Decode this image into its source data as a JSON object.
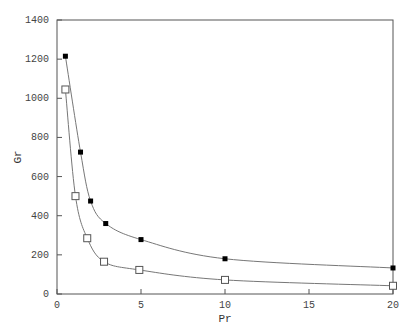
{
  "chart_data": {
    "type": "line",
    "title": "",
    "xlabel": "Pr",
    "ylabel": "Gr",
    "xlim": [
      0,
      20
    ],
    "ylim": [
      0,
      1400
    ],
    "xticks": [
      0,
      5,
      10,
      15,
      20
    ],
    "yticks": [
      0,
      200,
      400,
      600,
      800,
      1000,
      1200,
      1400
    ],
    "grid": false,
    "legend": null,
    "series": [
      {
        "name": "filled-squares",
        "marker": "filled-square",
        "color": "#000000",
        "x": [
          0.5,
          1.4,
          2.0,
          2.9,
          5.0,
          10.0,
          20.0
        ],
        "y": [
          1215,
          725,
          475,
          360,
          278,
          180,
          133
        ]
      },
      {
        "name": "open-squares",
        "marker": "open-square",
        "color": "#555555",
        "x": [
          0.5,
          1.1,
          1.8,
          2.8,
          4.9,
          10.0,
          20.0
        ],
        "y": [
          1045,
          500,
          285,
          165,
          123,
          72,
          42
        ]
      }
    ]
  },
  "axes": {
    "x_title": "Pr",
    "y_title": "Gr",
    "x_tick_labels": [
      "0",
      "5",
      "10",
      "15",
      "20"
    ],
    "y_tick_labels": [
      "0",
      "200",
      "400",
      "600",
      "800",
      "1000",
      "1200",
      "1400"
    ]
  }
}
